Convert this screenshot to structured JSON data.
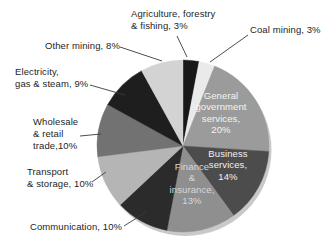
{
  "chart_data": {
    "type": "pie",
    "title": "",
    "start_angle_deg": 0,
    "direction": "clockwise",
    "legend_position": "outside-callouts",
    "slices": [
      {
        "label": "Agriculture, forestry & fishing",
        "value": 3,
        "color": "#181818"
      },
      {
        "label": "Coal mining",
        "value": 3,
        "color": "#eaeaea"
      },
      {
        "label": "General government services",
        "value": 20,
        "color": "#9b9b9b"
      },
      {
        "label": "Business services",
        "value": 14,
        "color": "#4c4c4c"
      },
      {
        "label": "Finance & insurance",
        "value": 13,
        "color": "#8f8f8f"
      },
      {
        "label": "Communication",
        "value": 10,
        "color": "#2b2b2b"
      },
      {
        "label": "Transport & storage",
        "value": 10,
        "color": "#b5b5b5"
      },
      {
        "label": "Wholesale & retail trade",
        "value": 10,
        "color": "#727272"
      },
      {
        "label": "Electricity, gas & steam",
        "value": 9,
        "color": "#1e1e1e"
      },
      {
        "label": "Other mining",
        "value": 8,
        "color": "#d3d3d3"
      }
    ]
  },
  "labels": {
    "agriculture": "Agriculture, forestry\n& fishing, 3%",
    "coal": "Coal mining, 3%",
    "other_mining": "Other mining, 8%",
    "electricity": "Electricity,\ngas & steam, 9%",
    "wholesale": "Wholesale\n& retail\ntrade,10%",
    "transport": "Transport\n& storage, 10%",
    "communication": "Communication, 10%",
    "general_government": "General\ngovernment\nservices,\n20%",
    "business": "Business\nservices,\n14%",
    "finance": "Finance\n&\ninsurance,\n13%"
  },
  "colors": {
    "background": "#ffffff",
    "label_text": "#1e1e1e",
    "inner_text_light": "#f4f4f4",
    "inner_text_gray": "#d8d8d8",
    "leader_line": "#3a3a3a",
    "shadow": "#c9c9c9"
  }
}
